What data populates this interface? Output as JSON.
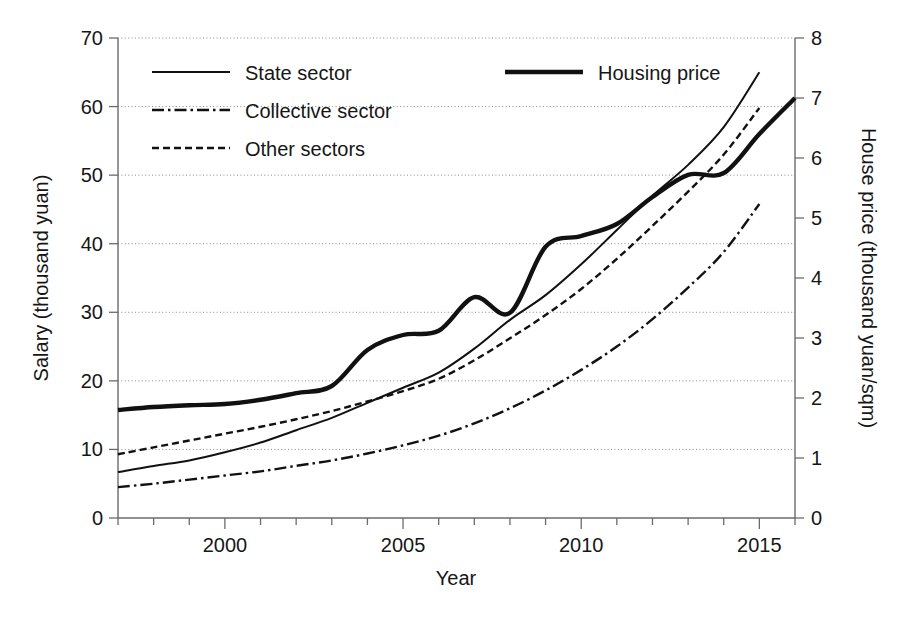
{
  "chart_data": {
    "type": "line",
    "title": "",
    "xlabel": "Year",
    "ylabel": "Salary (thousand yuan)",
    "y2label": "House price (thousand yuan/sqm)",
    "xlim": [
      1997,
      2016
    ],
    "ylim": [
      0,
      70
    ],
    "y2lim": [
      0,
      8
    ],
    "xticks": [
      2000,
      2005,
      2010,
      2015
    ],
    "xtick_labels": [
      "2000",
      "2005",
      "2010",
      "2015"
    ],
    "xminor_ticks": [
      1997,
      1998,
      1999,
      2000,
      2001,
      2002,
      2003,
      2004,
      2005,
      2006,
      2007,
      2008,
      2009,
      2010,
      2011,
      2012,
      2013,
      2014,
      2015,
      2016
    ],
    "yticks": [
      0,
      10,
      20,
      30,
      40,
      50,
      60,
      70
    ],
    "ytick_labels": [
      "0",
      "10",
      "20",
      "30",
      "40",
      "50",
      "60",
      "70"
    ],
    "y2ticks": [
      0,
      1,
      2,
      3,
      4,
      5,
      6,
      7,
      8
    ],
    "y2tick_labels": [
      "0",
      "1",
      "2",
      "3",
      "4",
      "5",
      "6",
      "7",
      "8"
    ],
    "grid": true,
    "grid_axis": "y",
    "legend_position": "upper-left",
    "x": [
      1997,
      1998,
      1999,
      2000,
      2001,
      2002,
      2003,
      2004,
      2005,
      2006,
      2007,
      2008,
      2009,
      2010,
      2011,
      2012,
      2013,
      2014,
      2015,
      2016
    ],
    "series": [
      {
        "name": "State sector",
        "axis": "left",
        "units": "thousand yuan",
        "style": "solid-thin",
        "values": [
          6.7,
          7.6,
          8.4,
          9.6,
          11.0,
          12.8,
          14.6,
          16.8,
          19.0,
          21.2,
          24.7,
          28.9,
          32.5,
          37.0,
          42.0,
          47.0,
          51.5,
          57.0,
          65.0,
          null
        ]
      },
      {
        "name": "Collective sector",
        "axis": "left",
        "units": "thousand yuan",
        "style": "dash-dot",
        "values": [
          4.5,
          5.0,
          5.6,
          6.2,
          6.8,
          7.6,
          8.4,
          9.4,
          10.6,
          12.0,
          13.8,
          16.0,
          18.6,
          21.6,
          25.0,
          29.0,
          33.6,
          38.8,
          45.8,
          null
        ]
      },
      {
        "name": "Other sectors",
        "axis": "left",
        "units": "thousand yuan",
        "style": "dotted",
        "values": [
          9.3,
          10.3,
          11.3,
          12.3,
          13.3,
          14.4,
          15.6,
          17.0,
          18.5,
          20.3,
          23.0,
          26.2,
          29.6,
          33.4,
          37.8,
          42.6,
          47.6,
          53.0,
          59.8,
          null
        ]
      },
      {
        "name": "Housing price",
        "axis": "right",
        "units": "thousand yuan/sqm",
        "style": "solid-thick",
        "values": [
          1.8,
          1.85,
          1.88,
          1.9,
          1.97,
          2.08,
          2.2,
          2.8,
          3.05,
          3.12,
          3.68,
          3.42,
          4.52,
          4.7,
          4.9,
          5.35,
          5.72,
          5.75,
          6.4,
          7.0
        ]
      }
    ],
    "annotations": [
      {
        "text": "Housing price peaks locally in 2007 then dips in 2008"
      },
      {
        "text": "Housing price plateaus 2013-2014 before rising to 2016"
      }
    ]
  },
  "legend": {
    "entries": [
      {
        "label": "State sector",
        "style": "solid-thin"
      },
      {
        "label": "Collective sector",
        "style": "dash-dot"
      },
      {
        "label": "Other sectors",
        "style": "dotted"
      },
      {
        "label": "Housing price",
        "style": "solid-thick"
      }
    ]
  },
  "axes": {
    "x_title": "Year",
    "y_left_title": "Salary (thousand yuan)",
    "y_right_title": "House price (thousand yuan/sqm)"
  },
  "colors": {
    "line": "#111111",
    "axis": "#6b6b6b",
    "grid": "#8a8a8a",
    "background": "#ffffff"
  }
}
